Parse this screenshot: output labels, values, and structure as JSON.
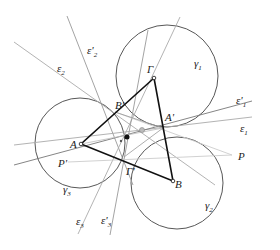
{
  "diagram": {
    "points": {
      "A": {
        "label": "A",
        "x": 81,
        "y": 144
      },
      "B": {
        "label": "B",
        "x": 173,
        "y": 181
      },
      "G": {
        "label": "Γ",
        "x": 154,
        "y": 78
      },
      "A1": {
        "label": "A'",
        "x": 163,
        "y": 128
      },
      "B1": {
        "label": "B'",
        "x": 115,
        "y": 112
      },
      "G1": {
        "label": "Γ'",
        "x": 124,
        "y": 157
      },
      "P": {
        "label": "P",
        "x": 0,
        "y": 0
      },
      "P1": {
        "label": "P'",
        "x": 0,
        "y": 0
      }
    },
    "circles": [
      {
        "name": "γ1",
        "label": "γ",
        "sub": "1"
      },
      {
        "name": "γ2",
        "label": "γ",
        "sub": "2"
      },
      {
        "name": "γ3",
        "label": "γ",
        "sub": "3"
      }
    ],
    "lines": [
      {
        "name": "ε1",
        "label": "ε",
        "sub": "1"
      },
      {
        "name": "ε'1",
        "label": "ε'",
        "sub": "1"
      },
      {
        "name": "ε2",
        "label": "ε",
        "sub": "2"
      },
      {
        "name": "ε'2",
        "label": "ε'",
        "sub": "2"
      },
      {
        "name": "ε3",
        "label": "ε",
        "sub": "3"
      },
      {
        "name": "ε'3",
        "label": "ε'",
        "sub": "3"
      }
    ]
  },
  "labels": {
    "A": "A",
    "B": "B",
    "G": "Γ",
    "A1": "A'",
    "B1": "B'",
    "G1": "Γ'",
    "P": "P",
    "P1": "P'",
    "gamma": "γ",
    "eps": "ε",
    "eps_p": "ε'",
    "s1": "1",
    "s2": "2",
    "s3": "3"
  }
}
